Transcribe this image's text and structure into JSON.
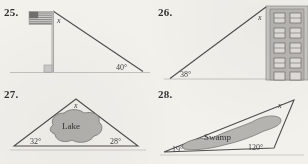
{
  "page": {
    "kind": "textbook-exercise-figures",
    "background_color": "#f3f1ec",
    "ink_color": "#3a3a3a"
  },
  "problems": [
    {
      "number": "25.",
      "figure": "flagpole-right-triangle",
      "unknown_label": "x",
      "angle_label": "40°",
      "has_right_angle_marker": true,
      "icon": "american-flag-icon"
    },
    {
      "number": "26.",
      "figure": "building-right-triangle",
      "unknown_label": "x",
      "angle_label": "38°",
      "has_right_angle_marker": false,
      "icon": "apartment-building-icon",
      "window_rows": 5,
      "window_cols": 2
    },
    {
      "number": "27.",
      "figure": "lake-triangle",
      "unknown_label": "x",
      "angle_left": "32°",
      "angle_right": "28°",
      "region_label": "Lake"
    },
    {
      "number": "28.",
      "figure": "swamp-triangle",
      "unknown_label": "x",
      "angle_left": "19°",
      "angle_right": "120°",
      "region_label": "Swamp"
    }
  ]
}
